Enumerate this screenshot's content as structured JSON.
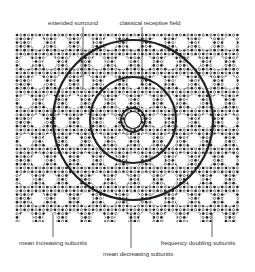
{
  "labels": {
    "top": [
      {
        "id": "extended-surround",
        "text": "extended surround",
        "x": 73,
        "y": 19,
        "line_x": 83
      },
      {
        "id": "classical-receptive-field",
        "text": "classical receptive field",
        "x": 150,
        "y": 19,
        "line_x": 142
      }
    ],
    "bottom": [
      {
        "id": "mean-increasing-subunits",
        "text": "mean increasing subunits",
        "x": 53,
        "y": 239,
        "line_x": 53
      },
      {
        "id": "frequency-doubling-subunits",
        "text": "frequency doubling subunits",
        "x": 198,
        "y": 239,
        "line_x": 212
      },
      {
        "id": "mean-decreasing-subunits",
        "text": "mean decreasing subunits",
        "x": 138,
        "y": 250,
        "line_x": 131
      }
    ]
  },
  "grid": {
    "x": 15,
    "y": 33,
    "width": 225,
    "height": 189,
    "dot_pitch": 3.8,
    "big_pitch_x": 24,
    "big_pitch_y": 19.5,
    "big_radius": 7
  },
  "rings": {
    "cx": 133,
    "cy": 120,
    "outer_r": 80,
    "middle_r": 43,
    "inner_r": 12,
    "innermost_r": 8.5
  },
  "colors": {
    "ink": "#222222",
    "background": "#ffffff",
    "text": "#333333"
  }
}
